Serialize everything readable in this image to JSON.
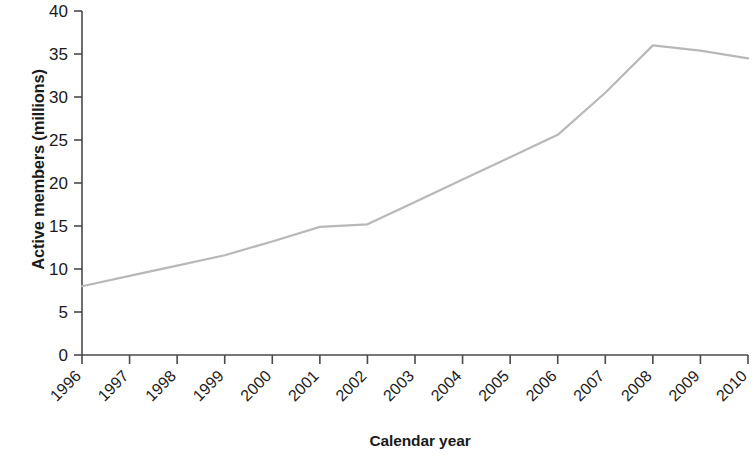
{
  "chart_data": {
    "type": "line",
    "title": "",
    "xlabel": "Calendar year",
    "ylabel": "Active members (millions)",
    "categories": [
      "1996",
      "1997",
      "1998",
      "1999",
      "2000",
      "2001",
      "2002",
      "2003",
      "2004",
      "2005",
      "2006",
      "2007",
      "2008",
      "2009",
      "2010"
    ],
    "values": [
      8.0,
      9.2,
      10.4,
      11.6,
      13.2,
      14.9,
      15.2,
      17.8,
      20.4,
      23.0,
      25.6,
      30.5,
      36.0,
      35.4,
      34.5
    ],
    "series": [
      {
        "name": "Active members",
        "color": "#b8b8b8",
        "values": [
          8.0,
          9.2,
          10.4,
          11.6,
          13.2,
          14.9,
          15.2,
          17.8,
          20.4,
          23.0,
          25.6,
          30.5,
          36.0,
          35.4,
          34.5
        ]
      }
    ],
    "x": [
      1996,
      1997,
      1998,
      1999,
      2000,
      2001,
      2002,
      2003,
      2004,
      2005,
      2006,
      2007,
      2008,
      2009,
      2010
    ],
    "ylim": [
      0,
      40
    ],
    "xlim": [
      1996,
      2010
    ],
    "ytick_labels": [
      "0",
      "5",
      "10",
      "15",
      "20",
      "25",
      "30",
      "35",
      "40"
    ],
    "ytick_values": [
      0,
      5,
      10,
      15,
      20,
      25,
      30,
      35,
      40
    ],
    "xtick_labels": [
      "1996",
      "1997",
      "1998",
      "1999",
      "2000",
      "2001",
      "2002",
      "2003",
      "2004",
      "2005",
      "2006",
      "2007",
      "2008",
      "2009",
      "2010"
    ],
    "grid": false,
    "legend": null,
    "xtick_label_rotation_deg": 45,
    "axis_color": "#4a4a4a",
    "line_color": "#b8b8b8"
  }
}
